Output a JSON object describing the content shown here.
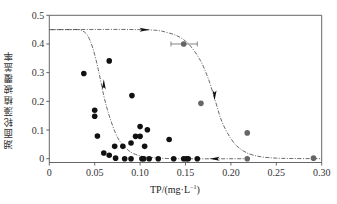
{
  "chart_data": {
    "type": "scatter",
    "title": "",
    "xlabel": "TP/(mg·L⁻¹)",
    "xlabel_base": "TP/(mg·L",
    "xlabel_sup": "−1",
    "xlabel_close": ")",
    "ylabel": "湖面轮藻植被覆盖率",
    "xlim": [
      0,
      0.3
    ],
    "ylim": [
      0,
      0.5
    ],
    "xticks": [
      0,
      0.05,
      0.1,
      0.15,
      0.2,
      0.25,
      0.3
    ],
    "xtick_labels": [
      "0",
      "0.05",
      "0.10",
      "0.15",
      "0.20",
      "0.25",
      "0.30"
    ],
    "yticks": [
      0,
      0.1,
      0.2,
      0.3,
      0.4,
      0.5
    ],
    "ytick_labels": [
      "0",
      "0.1",
      "0.2",
      "0.3",
      "0.4",
      "0.5"
    ],
    "grid": false,
    "legend": null,
    "series": [
      {
        "name": "black points",
        "color": "#111111",
        "points": [
          [
            0.038,
            0.297
          ],
          [
            0.066,
            0.341
          ],
          [
            0.05,
            0.169
          ],
          [
            0.05,
            0.148
          ],
          [
            0.053,
            0.079
          ],
          [
            0.06,
            0.02
          ],
          [
            0.066,
            0.012
          ],
          [
            0.073,
            0.002
          ],
          [
            0.072,
            0.043
          ],
          [
            0.081,
            0.043
          ],
          [
            0.083,
            0.0
          ],
          [
            0.09,
            0.0
          ],
          [
            0.09,
            0.055
          ],
          [
            0.091,
            0.22
          ],
          [
            0.095,
            0.078
          ],
          [
            0.1,
            0.112
          ],
          [
            0.1,
            0.078
          ],
          [
            0.102,
            0.0
          ],
          [
            0.104,
            0.0
          ],
          [
            0.105,
            0.043
          ],
          [
            0.108,
            0.101
          ],
          [
            0.11,
            0.0
          ],
          [
            0.12,
            0.0
          ],
          [
            0.132,
            0.067
          ],
          [
            0.137,
            0.0
          ],
          [
            0.148,
            0.0
          ],
          [
            0.151,
            0.0
          ],
          [
            0.153,
            0.0
          ],
          [
            0.163,
            0.0
          ]
        ]
      },
      {
        "name": "gray points",
        "color": "#666666",
        "points": [
          [
            0.148,
            0.4
          ],
          [
            0.167,
            0.193
          ],
          [
            0.218,
            0.09
          ],
          [
            0.218,
            0.0
          ],
          [
            0.291,
            0.002
          ]
        ],
        "error_bar": {
          "x": 0.148,
          "y": 0.4,
          "xmin": 0.134,
          "xmax": 0.163
        }
      }
    ],
    "curves": [
      {
        "name": "forward (loss) path",
        "style": "dashed",
        "direction": "right then down",
        "points": [
          [
            0,
            0.45
          ],
          [
            0.1,
            0.45
          ],
          [
            0.13,
            0.44
          ],
          [
            0.15,
            0.41
          ],
          [
            0.165,
            0.35
          ],
          [
            0.175,
            0.28
          ],
          [
            0.183,
            0.2
          ],
          [
            0.19,
            0.13
          ],
          [
            0.2,
            0.07
          ],
          [
            0.21,
            0.035
          ],
          [
            0.225,
            0.012
          ],
          [
            0.25,
            0.002
          ],
          [
            0.3,
            0.0
          ]
        ]
      },
      {
        "name": "recovery path",
        "style": "dashed",
        "direction": "left then up",
        "points": [
          [
            0.22,
            0.0
          ],
          [
            0.14,
            0.0
          ],
          [
            0.11,
            0.005
          ],
          [
            0.095,
            0.015
          ],
          [
            0.085,
            0.035
          ],
          [
            0.075,
            0.075
          ],
          [
            0.066,
            0.15
          ],
          [
            0.06,
            0.22
          ],
          [
            0.054,
            0.31
          ],
          [
            0.048,
            0.385
          ],
          [
            0.042,
            0.43
          ],
          [
            0.035,
            0.448
          ],
          [
            0.025,
            0.45
          ],
          [
            0,
            0.45
          ]
        ]
      }
    ],
    "annotations": [
      {
        "type": "arrow",
        "at": [
          0.105,
          0.45
        ],
        "direction": "right"
      },
      {
        "type": "arrow",
        "at": [
          0.182,
          0.22
        ],
        "direction": "down"
      },
      {
        "type": "arrow",
        "at": [
          0.182,
          0.0
        ],
        "direction": "left"
      },
      {
        "type": "arrow",
        "at": [
          0.06,
          0.26
        ],
        "direction": "up"
      }
    ]
  }
}
